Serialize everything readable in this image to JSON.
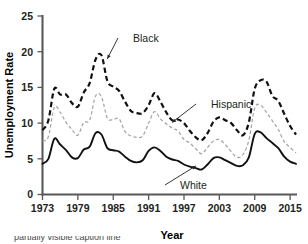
{
  "chart_data": {
    "type": "line",
    "title": "",
    "xlabel": "Year",
    "ylabel": "Unemployment Rate",
    "xlim": [
      1973,
      2016
    ],
    "ylim": [
      0,
      25
    ],
    "grid": false,
    "legend_position": "inline-annotations",
    "xticks": [
      "1973",
      "1979",
      "1985",
      "1991",
      "1997",
      "2003",
      "2009",
      "2015"
    ],
    "xtick_values": [
      1973,
      1979,
      1985,
      1991,
      1997,
      2003,
      2009,
      2015
    ],
    "yticks": [
      "0",
      "5",
      "10",
      "15",
      "20",
      "25"
    ],
    "ytick_values": [
      0,
      5,
      10,
      15,
      20,
      25
    ],
    "x": [
      1973,
      1974,
      1975,
      1976,
      1977,
      1978,
      1979,
      1980,
      1981,
      1982,
      1983,
      1984,
      1985,
      1986,
      1987,
      1988,
      1989,
      1990,
      1991,
      1992,
      1993,
      1994,
      1995,
      1996,
      1997,
      1998,
      1999,
      2000,
      2001,
      2002,
      2003,
      2004,
      2005,
      2006,
      2007,
      2008,
      2009,
      2010,
      2011,
      2012,
      2013,
      2014,
      2015,
      2016
    ],
    "series": [
      {
        "name": "Black",
        "style": "thick-dashed",
        "color": "#111111",
        "values": [
          9.0,
          10.4,
          14.8,
          14.0,
          14.0,
          12.8,
          12.3,
          14.3,
          15.6,
          18.9,
          19.5,
          15.9,
          15.1,
          14.5,
          13.0,
          11.7,
          11.4,
          11.4,
          12.5,
          14.2,
          13.0,
          11.5,
          10.4,
          10.5,
          10.0,
          8.9,
          8.0,
          7.6,
          8.6,
          10.2,
          10.8,
          10.4,
          10.0,
          9.0,
          8.3,
          10.1,
          14.8,
          16.0,
          15.8,
          13.8,
          13.1,
          11.3,
          9.6,
          8.4
        ]
      },
      {
        "name": "Hispanic",
        "style": "thin-dashed",
        "color": "#a6a6a6",
        "values": [
          7.5,
          8.1,
          12.2,
          11.5,
          10.1,
          9.1,
          8.3,
          10.1,
          10.4,
          13.8,
          13.7,
          10.7,
          10.5,
          10.6,
          8.8,
          8.2,
          8.0,
          8.2,
          10.0,
          11.6,
          10.6,
          9.9,
          9.3,
          8.9,
          7.7,
          7.2,
          6.4,
          5.7,
          6.6,
          7.5,
          7.7,
          7.0,
          6.0,
          5.2,
          5.6,
          7.6,
          12.1,
          12.5,
          11.5,
          10.3,
          9.1,
          7.4,
          6.6,
          5.8
        ]
      },
      {
        "name": "White",
        "style": "solid",
        "color": "#111111",
        "values": [
          4.3,
          5.0,
          7.8,
          7.0,
          6.2,
          5.2,
          5.1,
          6.3,
          6.7,
          8.6,
          8.4,
          6.5,
          6.2,
          6.0,
          5.3,
          4.7,
          4.5,
          4.8,
          6.1,
          6.6,
          6.1,
          5.3,
          4.9,
          4.7,
          4.2,
          3.9,
          3.7,
          3.5,
          4.2,
          5.1,
          5.2,
          4.8,
          4.4,
          4.0,
          4.1,
          5.2,
          8.5,
          8.7,
          7.9,
          7.2,
          6.5,
          5.3,
          4.6,
          4.3
        ]
      }
    ],
    "annotations": [
      {
        "label": "Black",
        "target_series": "Black",
        "target_year": 1984,
        "target_value": 19.0
      },
      {
        "label": "Hispanic",
        "target_series": "Hispanic",
        "target_year": 1995,
        "target_value": 10.1
      },
      {
        "label": "White",
        "target_series": "White",
        "target_year": 1999,
        "target_value": 4.0
      }
    ]
  },
  "caption": {
    "text": "partially visible caption line"
  }
}
